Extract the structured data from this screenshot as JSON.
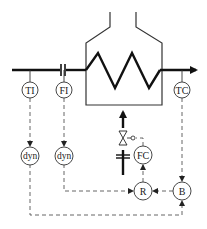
{
  "diagram": {
    "type": "process-control-schematic",
    "colors": {
      "line": "#111111",
      "signal": "#555555",
      "background": "#ffffff"
    },
    "instruments": [
      {
        "id": "ti",
        "label": "TI",
        "cx": 30,
        "cy": 90
      },
      {
        "id": "fi",
        "label": "FI",
        "cx": 64,
        "cy": 90
      },
      {
        "id": "tc",
        "label": "TC",
        "cx": 182,
        "cy": 90
      },
      {
        "id": "dyn1",
        "label": "dyn",
        "cx": 30,
        "cy": 156
      },
      {
        "id": "dyn2",
        "label": "dyn",
        "cx": 64,
        "cy": 156
      },
      {
        "id": "fc",
        "label": "FC",
        "cx": 143,
        "cy": 155
      },
      {
        "id": "r",
        "label": "R",
        "cx": 143,
        "cy": 191
      },
      {
        "id": "b",
        "label": "B",
        "cx": 182,
        "cy": 191
      }
    ],
    "equipment": [
      {
        "id": "furnace",
        "label": "furnace with heating coil"
      },
      {
        "id": "orifice",
        "label": "flow orifice"
      },
      {
        "id": "control-valve",
        "label": "fuel control valve"
      },
      {
        "id": "fuel-orifice",
        "label": "fuel flow orifice"
      }
    ],
    "signals": [
      {
        "from": "TI",
        "to": "dyn"
      },
      {
        "from": "FI",
        "to": "dyn"
      },
      {
        "from": "TC",
        "to": "B"
      },
      {
        "from": "dyn (FI)",
        "to": "R"
      },
      {
        "from": "dyn (TI)",
        "to": "B"
      },
      {
        "from": "B",
        "to": "R"
      },
      {
        "from": "R",
        "to": "FC"
      },
      {
        "from": "FC",
        "to": "valve"
      }
    ]
  }
}
